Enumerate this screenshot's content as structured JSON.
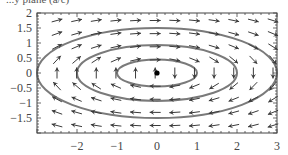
{
  "chart_data": {
    "type": "vector_field_with_contours",
    "title": "...y plane (a/c)",
    "xlabel": "",
    "ylabel": "",
    "xlim": [
      -3,
      3
    ],
    "ylim": [
      -2,
      2
    ],
    "x_ticks": [
      -2,
      -1,
      0,
      1,
      2,
      3
    ],
    "x_tick_labels": [
      "−2",
      "−1",
      "0",
      "1",
      "2",
      "3"
    ],
    "y_ticks": [
      2,
      1.5,
      1,
      0.5,
      0,
      -0.5,
      -1,
      -1.5
    ],
    "y_tick_labels": [
      "2",
      "1.5",
      "1",
      "0.5",
      "0",
      "−0.5",
      "−1",
      "−1.5"
    ],
    "grid": false,
    "vector_field": {
      "description": "clockwise rotation about origin; dx/dt proportional to 4y, dy/dt proportional to -x",
      "columns": 12,
      "rows": 9,
      "x_range": [
        -2.5,
        2.9
      ],
      "y_range": [
        1.75,
        -1.75
      ],
      "arrow_color": "#3a3a3a"
    },
    "contours": [
      {
        "name": "inner ellipse",
        "a": 1,
        "b": 0.45
      },
      {
        "name": "middle ellipse",
        "a": 2,
        "b": 0.93
      },
      {
        "name": "outer ellipse",
        "a": 3,
        "b": 1.5
      }
    ],
    "contour_color": "#7a7a7a",
    "equilibrium_point": {
      "x": 0,
      "y": 0,
      "color": "#000000"
    }
  }
}
